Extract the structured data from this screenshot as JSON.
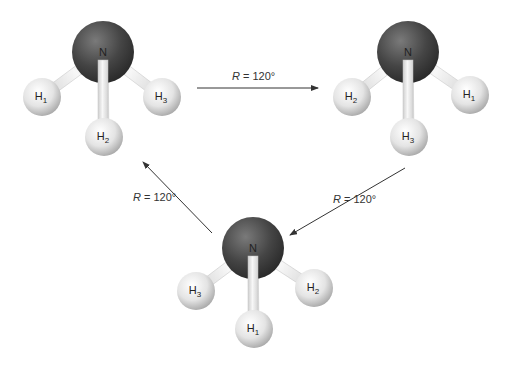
{
  "diagram": {
    "type": "rotation-symmetry",
    "molecules": [
      {
        "id": "molecule-1",
        "central_atom": {
          "label": "N",
          "x": 103,
          "y": 52
        },
        "hydrogens": [
          {
            "label": "H",
            "sub": "1",
            "x": 42,
            "y": 97
          },
          {
            "label": "H",
            "sub": "2",
            "x": 104,
            "y": 137
          },
          {
            "label": "H",
            "sub": "3",
            "x": 162,
            "y": 97
          }
        ]
      },
      {
        "id": "molecule-2",
        "central_atom": {
          "label": "N",
          "x": 408,
          "y": 52
        },
        "hydrogens": [
          {
            "label": "H",
            "sub": "2",
            "x": 352,
            "y": 97
          },
          {
            "label": "H",
            "sub": "3",
            "x": 409,
            "y": 137
          },
          {
            "label": "H",
            "sub": "1",
            "x": 470,
            "y": 95
          }
        ]
      },
      {
        "id": "molecule-3",
        "central_atom": {
          "label": "N",
          "x": 253,
          "y": 248
        },
        "hydrogens": [
          {
            "label": "H",
            "sub": "3",
            "x": 196,
            "y": 291
          },
          {
            "label": "H",
            "sub": "1",
            "x": 254,
            "y": 329
          },
          {
            "label": "H",
            "sub": "2",
            "x": 314,
            "y": 288
          }
        ]
      }
    ],
    "arrows": [
      {
        "from": "molecule-1",
        "to": "molecule-2",
        "label_var": "R",
        "label_value": " = 120°",
        "x1": 197,
        "y1": 88,
        "x2": 318,
        "y2": 88,
        "lx": 232,
        "ly": 80
      },
      {
        "from": "molecule-2",
        "to": "molecule-3",
        "label_var": "R",
        "label_value": " = 120°",
        "x1": 405,
        "y1": 168,
        "x2": 290,
        "y2": 235,
        "lx": 333,
        "ly": 203
      },
      {
        "from": "molecule-3",
        "to": "molecule-1",
        "label_var": "R",
        "label_value": " = 120°",
        "x1": 212,
        "y1": 233,
        "x2": 143,
        "y2": 162,
        "lx": 133,
        "ly": 201
      }
    ],
    "colors": {
      "nitrogen_dark": "#2e2e2e",
      "nitrogen_light": "#7a7a7a",
      "hydrogen_light": "#ffffff",
      "hydrogen_dark": "#a8a8a8",
      "bond": "#e6e6e6",
      "arrow": "#333333"
    }
  }
}
